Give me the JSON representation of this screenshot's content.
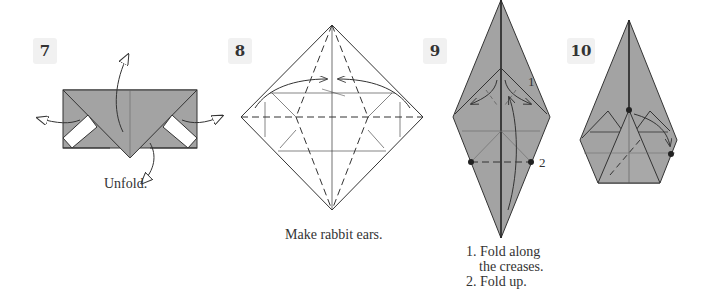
{
  "steps": [
    {
      "number": "7",
      "caption": "Unfold."
    },
    {
      "number": "8",
      "caption": "Make rabbit ears."
    },
    {
      "number": "9",
      "captions": [
        "1. Fold along",
        "the creases.",
        "2. Fold up."
      ],
      "markers": [
        "1",
        "2"
      ]
    },
    {
      "number": "10",
      "caption": ""
    }
  ],
  "colors": {
    "paper": "#a3a3a3",
    "line": "#333333",
    "badge": "#f1f1f1"
  }
}
